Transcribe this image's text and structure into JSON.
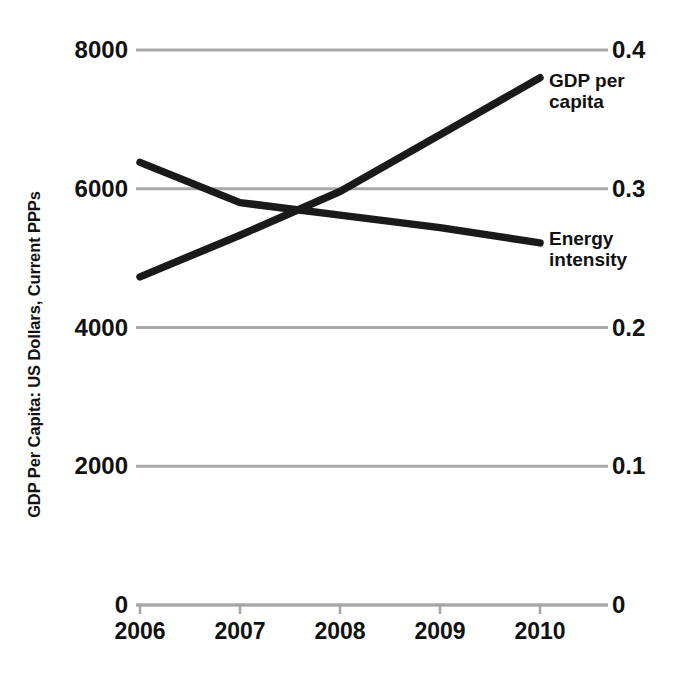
{
  "chart_data": {
    "type": "line",
    "title": "",
    "subtitle": "",
    "xlabel": "",
    "ylabel": "GDP Per Capita: US Dollars, Current PPPs",
    "y2label": "",
    "categories": [
      "2006",
      "2007",
      "2008",
      "2009",
      "2010"
    ],
    "x": [
      2006,
      2007,
      2008,
      2009,
      2010
    ],
    "xlim": [
      2005.5,
      2010.9
    ],
    "ylim": [
      0,
      8000
    ],
    "y2lim": [
      0,
      0.4
    ],
    "yticks": [
      "0",
      "2000",
      "4000",
      "6000",
      "8000"
    ],
    "ytick_values": [
      0,
      2000,
      4000,
      6000,
      8000
    ],
    "y2ticks": [
      "0",
      "0.1",
      "0.2",
      "0.3",
      "0.4"
    ],
    "y2tick_values": [
      0,
      0.1,
      0.2,
      0.3,
      0.4
    ],
    "grid": true,
    "grid_color": "#a8a8a8",
    "legend_position": "inline-right-of-line-ends",
    "series": [
      {
        "name": "GDP per capita",
        "axis": "left",
        "color": "#1a1a1a",
        "label_line1": "GDP per",
        "label_line2": "capita",
        "values": [
          4730,
          5330,
          5960,
          6780,
          7600
        ]
      },
      {
        "name": "Energy intensity",
        "axis": "right",
        "color": "#1a1a1a",
        "label_line1": "Energy",
        "label_line2": "intensity",
        "values": [
          0.319,
          0.29,
          0.281,
          0.272,
          0.261
        ]
      }
    ],
    "annotations": []
  },
  "axis": {
    "y_title": "GDP Per Capita: US Dollars, Current PPPs"
  },
  "colors": {
    "ink": "#111111",
    "gridline": "#a8a8a8",
    "series": "#1a1a1a",
    "background": "#ffffff"
  }
}
